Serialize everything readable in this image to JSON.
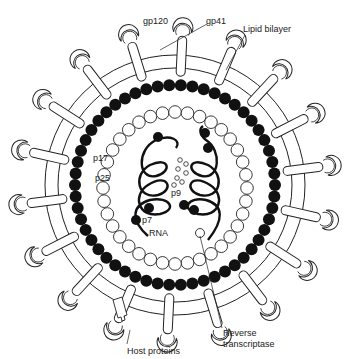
{
  "labels": {
    "gp120": "gp120",
    "gp41": "gp41",
    "lipid_bilayer": "Lipid bilayer",
    "p17": "p17",
    "p25": "p25",
    "p9": "p9",
    "p7": "p7",
    "rna": "RNA",
    "host_proteins": "Host proteins",
    "reverse_transcriptase_line1": "Reverse",
    "reverse_transcriptase_line2": "transcriptase"
  },
  "geometry": {
    "center": [
      175,
      185
    ],
    "outer_membrane_radius": 130,
    "inner_membrane_radius": 117,
    "matrix_ring_radius": 100,
    "capsid_ring_radius": 72,
    "spike_count": 18
  },
  "colors": {
    "line": "#222222",
    "fill_dark": "#111111",
    "background": "#ffffff"
  }
}
